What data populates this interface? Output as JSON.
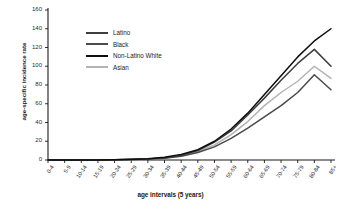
{
  "chart_data": {
    "type": "line",
    "title": "",
    "xlabel": "age intervals (5 years)",
    "ylabel": "age-specific incidence rate",
    "categories": [
      "0-4",
      "5-9",
      "10-14",
      "15-19",
      "20-24",
      "25-29",
      "30-34",
      "35-39",
      "40-44",
      "45-49",
      "50-54",
      "55-59",
      "60-64",
      "65-69",
      "70-74",
      "75-79",
      "80-84",
      "85+"
    ],
    "ylim": [
      0,
      160
    ],
    "yticks": [
      0,
      20,
      40,
      60,
      80,
      100,
      120,
      140,
      160
    ],
    "grid": false,
    "legend_position": "upper-left-inside",
    "series": [
      {
        "name": "Latino",
        "color": "#3d3d3d",
        "values": [
          0,
          0,
          0,
          0,
          0.3,
          0.6,
          1.2,
          2.5,
          5,
          10,
          19,
          31,
          48,
          66,
          85,
          103,
          118,
          100
        ]
      },
      {
        "name": "Black",
        "color": "#4a4a4a",
        "values": [
          0,
          0,
          0,
          0,
          0.2,
          0.5,
          1,
          2,
          4,
          8,
          14,
          23,
          34,
          46,
          58,
          72,
          91,
          75
        ]
      },
      {
        "name": "Non-Latino White",
        "color": "#0d0d0d",
        "values": [
          0,
          0,
          0,
          0,
          0.3,
          0.7,
          1.4,
          3,
          6,
          11,
          20,
          33,
          50,
          70,
          90,
          110,
          127,
          140
        ]
      },
      {
        "name": "Asian",
        "color": "#b3b3b3",
        "values": [
          0,
          0,
          0,
          0,
          0.2,
          0.5,
          1,
          2.2,
          4.5,
          9,
          16,
          27,
          41,
          58,
          72,
          84,
          100,
          87
        ]
      }
    ]
  },
  "axes": {
    "y_tick_labels": [
      "160",
      "140",
      "120",
      "100",
      "80",
      "60",
      "40",
      "20",
      "0"
    ],
    "y_title": "age-specific incidence rate",
    "x_title": "age intervals (5 years)"
  },
  "legend": {
    "items": [
      {
        "label": "Latino",
        "color": "#3d3d3d"
      },
      {
        "label": "Black",
        "color": "#4a4a4a"
      },
      {
        "label": "Non-Latino White",
        "color": "#0d0d0d"
      },
      {
        "label": "Asian",
        "color": "#b3b3b3"
      }
    ]
  }
}
